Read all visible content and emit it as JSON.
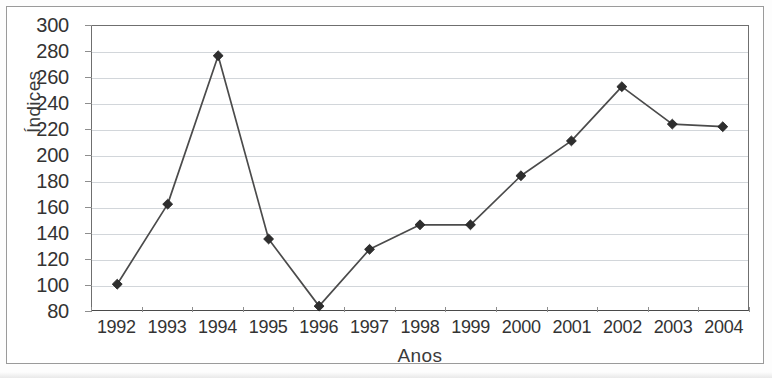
{
  "chart_data": {
    "type": "line",
    "title": "",
    "xlabel": "Anos",
    "ylabel": "Índices",
    "categories": [
      "1992",
      "1993",
      "1994",
      "1995",
      "1996",
      "1997",
      "1998",
      "1999",
      "2000",
      "2001",
      "2002",
      "2003",
      "2004"
    ],
    "values": [
      100,
      162,
      277,
      135,
      83,
      127,
      146,
      146,
      184,
      211,
      253,
      224,
      222
    ],
    "series": [
      {
        "name": "Índices",
        "values": [
          100,
          162,
          277,
          135,
          83,
          127,
          146,
          146,
          184,
          211,
          253,
          224,
          222
        ]
      }
    ],
    "ylim": [
      80,
      300
    ],
    "ytick_step": 20,
    "yticks": [
      "300",
      "280",
      "260",
      "240",
      "220",
      "200",
      "180",
      "160",
      "140",
      "120",
      "100",
      "80"
    ],
    "ytick_values": [
      300,
      280,
      260,
      240,
      220,
      200,
      180,
      160,
      140,
      120,
      100,
      80
    ],
    "grid": "horizontal",
    "legend": "none",
    "marker": "diamond",
    "colors": {
      "line": "#4b4b4b",
      "marker": "#2e2e2e",
      "gridline": "#d2d6da",
      "axis": "#6f6f6f",
      "text": "#333333",
      "frame": "#9a9a9a",
      "background": "#ffffff"
    }
  }
}
